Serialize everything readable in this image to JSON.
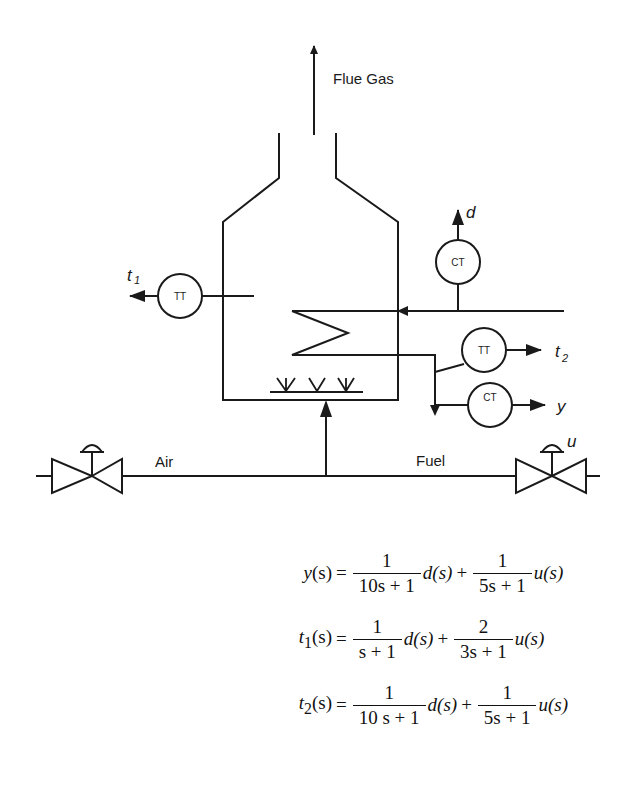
{
  "diagram": {
    "labels": {
      "flue_gas": "Flue Gas",
      "air": "Air",
      "fuel": "Fuel",
      "t1": "t",
      "t1_sub": "1",
      "t2": "t",
      "t2_sub": "2",
      "d": "d",
      "y": "y",
      "u": "u"
    },
    "instruments": [
      {
        "id": "tt1",
        "tag": "TT",
        "output": "t1"
      },
      {
        "id": "ct_d",
        "tag": "CT",
        "output": "d"
      },
      {
        "id": "tt2",
        "tag": "TT",
        "output": "t2"
      },
      {
        "id": "ct_y",
        "tag": "CT",
        "output": "y"
      }
    ],
    "valves": [
      {
        "id": "air-valve",
        "stream": "Air"
      },
      {
        "id": "fuel-valve",
        "stream": "Fuel",
        "signal": "u"
      }
    ],
    "colors": {
      "line": "#1a1a1a",
      "background": "#ffffff"
    }
  },
  "equations": [
    {
      "lhs_var": "y",
      "lhs_arg": "(s)",
      "eq": "=",
      "term1": {
        "num": "1",
        "den": "10s + 1",
        "var": "d(s)"
      },
      "plus": "+",
      "term2": {
        "num": "1",
        "den": "5s + 1",
        "var": "u(s)"
      }
    },
    {
      "lhs_var": "t",
      "lhs_sub": "1",
      "lhs_arg": "(s)",
      "eq": "=",
      "term1": {
        "num": "1",
        "den": "s + 1",
        "var": "d(s)"
      },
      "plus": "+",
      "term2": {
        "num": "2",
        "den": "3s + 1",
        "var": "u(s)"
      }
    },
    {
      "lhs_var": "t",
      "lhs_sub": "2",
      "lhs_arg": "(s)",
      "eq": "=",
      "term1": {
        "num": "1",
        "den": "10 s + 1",
        "var": "d(s)"
      },
      "plus": "+",
      "term2": {
        "num": "1",
        "den": "5s + 1",
        "var": "u(s)"
      }
    }
  ]
}
